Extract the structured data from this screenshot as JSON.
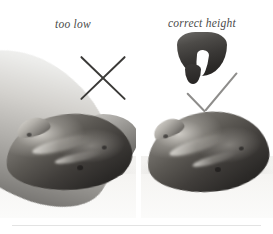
{
  "figure": {
    "kind": "instructional-photo-comparison",
    "palette": {
      "background": "#ffffff",
      "caption_text": "#4a4a4a",
      "x_mark": "#3b3a38",
      "check_mark": "#8e8d8b",
      "rule": "#e3e3e3",
      "loaf_dark": "#1f1d1c",
      "loaf_light": "#9e9b95"
    }
  },
  "panels": [
    {
      "id": "too-low",
      "caption": "too low",
      "verdict_icon": "x-mark-icon",
      "verdict": "incorrect",
      "photo_alt": "Black and white photo of a hand holding a scoring blade low against a dark rustic loaf of bread"
    },
    {
      "id": "correct-height",
      "caption": "correct height",
      "verdict_icon": "check-mark-icon",
      "verdict": "correct",
      "photo_alt": "Black and white photo of a hand holding a scoring blade high above a dark rustic loaf of bread"
    }
  ]
}
